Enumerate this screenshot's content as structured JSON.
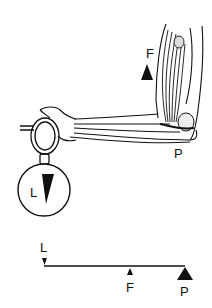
{
  "diagram": {
    "type": "third-class lever (forearm holding a weight)",
    "illustration": {
      "force_label": "F",
      "pivot_label": "P",
      "load_label": "L"
    },
    "schematic": {
      "load_label": "L",
      "force_label": "F",
      "pivot_label": "P"
    },
    "colors": {
      "ink": "#111111",
      "background": "#ffffff"
    }
  }
}
